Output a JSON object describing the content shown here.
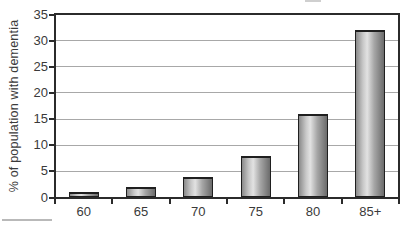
{
  "chart_data": {
    "type": "bar",
    "title": "",
    "categories": [
      "60",
      "65",
      "70",
      "75",
      "80",
      "85+"
    ],
    "values": [
      1,
      2,
      4,
      8,
      16,
      32
    ],
    "xlabel": "",
    "ylabel": "% of population with dementia",
    "ylim": [
      0,
      35
    ],
    "yticks": [
      0,
      5,
      10,
      15,
      20,
      25,
      30,
      35
    ],
    "grid": "horizontal",
    "legend": "none",
    "colors": {
      "background": "#ffffff",
      "axis": "#2b2b2b",
      "gridline": "#a8a8a8",
      "bar_outline": "#1f1f1f",
      "bar_fill_edges": "#6b6b6b",
      "bar_fill_highlight": "#e2e2e2",
      "text": "#3a3a3a"
    }
  }
}
